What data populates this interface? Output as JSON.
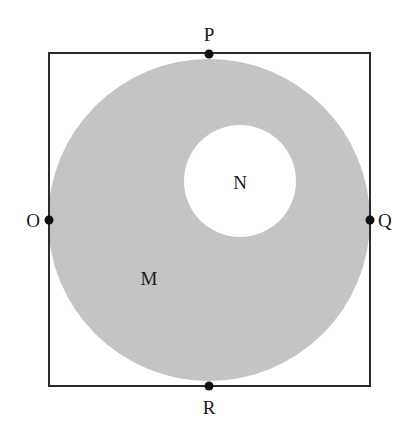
{
  "figure": {
    "square": {
      "x1": 49,
      "y1": 53,
      "x2": 370,
      "y2": 386,
      "stroke": "#2b2b2b"
    },
    "outer_circle": {
      "cx": 209,
      "cy": 220,
      "r": 161,
      "fill": "#c4c4c4",
      "label": "M"
    },
    "inner_circle": {
      "cx": 240,
      "cy": 181,
      "r": 56,
      "fill": "#ffffff",
      "label": "N"
    },
    "points": [
      {
        "name": "P",
        "x": 209,
        "y": 54
      },
      {
        "name": "Q",
        "x": 370,
        "y": 220
      },
      {
        "name": "R",
        "x": 209,
        "y": 386
      },
      {
        "name": "O",
        "x": 49,
        "y": 220
      }
    ],
    "labels": {
      "P": "P",
      "Q": "Q",
      "R": "R",
      "O": "O",
      "M": "M",
      "N": "N"
    }
  }
}
